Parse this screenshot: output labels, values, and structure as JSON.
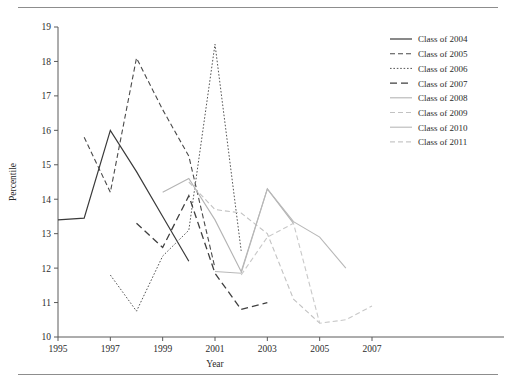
{
  "figure": {
    "has_top_rule": true,
    "has_bottom_rule": true,
    "background": "#ffffff"
  },
  "chart_data": {
    "type": "line",
    "title": "",
    "xlabel": "Year",
    "ylabel": "Percentile",
    "xlim": [
      1995,
      2007
    ],
    "ylim": [
      10,
      19
    ],
    "xticks": [
      1995,
      1997,
      1999,
      2001,
      2003,
      2005,
      2007
    ],
    "xtick_labels": [
      "1995",
      "1997",
      "1999",
      "2001",
      "2003",
      "2005",
      "2007"
    ],
    "yticks": [
      10,
      11,
      12,
      13,
      14,
      15,
      16,
      17,
      18,
      19
    ],
    "ytick_labels": [
      "10",
      "11",
      "12",
      "13",
      "14",
      "15",
      "16",
      "17",
      "18",
      "19"
    ],
    "grid": false,
    "legend_position": "right",
    "series": [
      {
        "name": "Class of 2004",
        "color": "#3a3a3a",
        "width": 1.2,
        "dash": "none",
        "x": [
          1995,
          1996,
          1997,
          1998,
          1999,
          2000
        ],
        "values": [
          13.4,
          13.45,
          16.0,
          14.8,
          13.5,
          12.2
        ]
      },
      {
        "name": "Class of 2005",
        "color": "#4a4a4a",
        "width": 1.1,
        "dash": "5,3",
        "x": [
          1996,
          1997,
          1998,
          1999,
          2000,
          2001
        ],
        "values": [
          15.8,
          14.2,
          18.1,
          16.6,
          15.25,
          12.0
        ]
      },
      {
        "name": "Class of 2006",
        "color": "#555555",
        "width": 1.0,
        "dash": "1.6,1.8",
        "x": [
          1997,
          1998,
          1999,
          2000,
          2001,
          2002
        ],
        "values": [
          11.8,
          10.75,
          12.35,
          13.1,
          18.5,
          12.5
        ]
      },
      {
        "name": "Class of 2007",
        "color": "#3f3f3f",
        "width": 1.3,
        "dash": "7,4",
        "x": [
          1998,
          1999,
          2000,
          2001,
          2002,
          2003
        ],
        "values": [
          13.3,
          12.6,
          14.1,
          11.85,
          10.8,
          11.0
        ]
      },
      {
        "name": "Class of 2008",
        "color": "#b4b4b4",
        "width": 1.1,
        "dash": "none",
        "x": [
          1999,
          2000,
          2001,
          2002,
          2003,
          2004
        ],
        "values": [
          14.2,
          14.6,
          13.4,
          11.9,
          14.3,
          13.3
        ]
      },
      {
        "name": "Class of 2009",
        "color": "#c2c2c2",
        "width": 1.1,
        "dash": "5,3",
        "x": [
          2000,
          2001,
          2002,
          2003,
          2004,
          2005
        ],
        "values": [
          14.5,
          13.7,
          13.6,
          13.0,
          11.1,
          10.4
        ]
      },
      {
        "name": "Class of 2010",
        "color": "#b8b8b8",
        "width": 1.1,
        "dash": "none",
        "x": [
          2001,
          2002,
          2003,
          2004,
          2005,
          2006
        ],
        "values": [
          11.9,
          11.85,
          14.3,
          13.35,
          12.9,
          12.0
        ]
      },
      {
        "name": "Class of 2011",
        "color": "#c8c8c8",
        "width": 1.1,
        "dash": "5,3",
        "x": [
          2002,
          2003,
          2004,
          2005,
          2006,
          2007
        ],
        "values": [
          11.8,
          12.9,
          13.3,
          10.4,
          10.5,
          10.9
        ]
      }
    ]
  }
}
